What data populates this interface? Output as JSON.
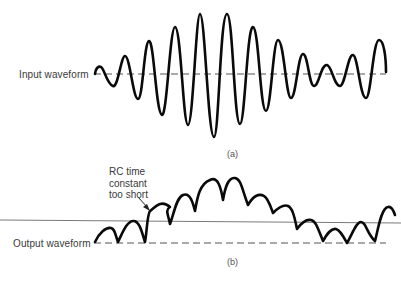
{
  "figure": {
    "panel_a": {
      "label": "Input waveform",
      "caption": "(a)"
    },
    "panel_b": {
      "label": "Output waveform",
      "caption": "(b)",
      "annotation": {
        "lines": [
          "RC time",
          "constant",
          "too short"
        ]
      }
    },
    "colors": {
      "waveform": "#0a0a0a",
      "baseline_dashed": "#555555",
      "reference_line": "#7a7a7a",
      "text": "#3a3a3a"
    }
  }
}
